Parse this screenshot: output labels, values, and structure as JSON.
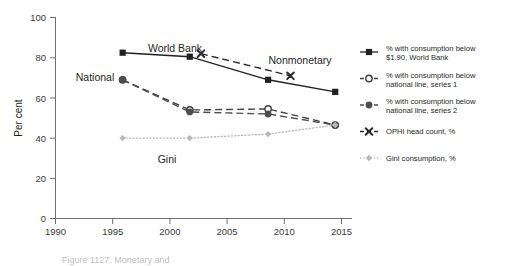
{
  "chart_data": {
    "type": "line",
    "title": "",
    "xlabel": "",
    "ylabel": "Per cent",
    "xlim": [
      1990,
      2016.5
    ],
    "ylim": [
      0,
      100
    ],
    "grid": false,
    "legend_position": "right",
    "xticks": [
      "1990",
      "1995",
      "2000",
      "2005",
      "2010",
      "2015"
    ],
    "xtick_values": [
      1990,
      1995,
      2000,
      2005,
      2010,
      2015
    ],
    "yticks": [
      "0",
      "20",
      "40",
      "60",
      "80",
      "100"
    ],
    "ytick_values": [
      0,
      20,
      40,
      60,
      80,
      100
    ],
    "series": [
      {
        "name": "% with consumption below $1.90, World Bank",
        "short_name": "World Bank",
        "marker": "filled-square",
        "line_style": "solid",
        "color": "#231f20",
        "x": [
          1996,
          2002,
          2009,
          2015
        ],
        "values": [
          82.5,
          80.5,
          69.0,
          63.0
        ]
      },
      {
        "name": "% with consumption below national line, series 1",
        "short_name": "National series 1",
        "marker": "open-circle",
        "line_style": "dashed",
        "color": "#404040",
        "x": [
          1996,
          2002,
          2009,
          2015
        ],
        "values": [
          69.0,
          54.0,
          54.5,
          46.5
        ]
      },
      {
        "name": "% with consumption below national line, series 2",
        "short_name": "National series 2",
        "marker": "filled-circle",
        "line_style": "dashed",
        "color": "#4d4d4d",
        "x": [
          1996,
          2002,
          2009,
          2015
        ],
        "values": [
          69.0,
          53.0,
          52.0,
          46.5
        ]
      },
      {
        "name": "OPHI head count, %",
        "short_name": "Nonmonetary",
        "marker": "x-cross",
        "line_style": "dashed",
        "color": "#2b2b2b",
        "x": [
          2003,
          2011
        ],
        "values": [
          82.0,
          71.0
        ]
      },
      {
        "name": "Gini consumption, %",
        "short_name": "Gini",
        "marker": "filled-diamond",
        "line_style": "dotted",
        "color": "#b7b7b7",
        "x": [
          1996,
          2002,
          2009,
          2015
        ],
        "values": [
          40.0,
          40.0,
          42.0,
          46.5
        ]
      }
    ],
    "annotations": [
      {
        "text": "World Bank",
        "x": 2000.5,
        "y": 87.5
      },
      {
        "text": "National",
        "x": 1993.2,
        "y": 70.5
      },
      {
        "text": "Nonmonetary",
        "x": 2009.6,
        "y": 77.5
      },
      {
        "text": "Gini",
        "x": 1999.6,
        "y": 34.0
      }
    ]
  },
  "legend": {
    "items": [
      {
        "label_line1": "% with consumption below",
        "label_line2": "$1.90, World Bank",
        "marker": "filled-square"
      },
      {
        "label_line1": "% with consumption below",
        "label_line2": "national line, series 1",
        "marker": "open-circle"
      },
      {
        "label_line1": "% with consumption below",
        "label_line2": "national line, series 2",
        "marker": "filled-circle"
      },
      {
        "label_line1": "OPHI head count, %",
        "label_line2": "",
        "marker": "x-cross"
      },
      {
        "label_line1": "Gini consumption, %",
        "label_line2": "",
        "marker": "filled-diamond"
      }
    ]
  },
  "caption": {
    "text": "Figure 1127. Monetary and"
  }
}
